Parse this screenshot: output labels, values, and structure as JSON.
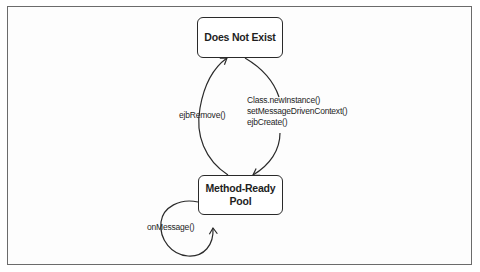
{
  "diagram": {
    "type": "state-diagram",
    "states": [
      {
        "id": "does_not_exist",
        "label": "Does Not Exist"
      },
      {
        "id": "method_ready_pool",
        "label_lines": [
          "Method-Ready",
          "Pool"
        ]
      }
    ],
    "transitions": [
      {
        "from": "does_not_exist",
        "to": "method_ready_pool",
        "labels": [
          "Class.newInstance()",
          "setMessageDrivenContext()",
          "ejbCreate()"
        ]
      },
      {
        "from": "method_ready_pool",
        "to": "does_not_exist",
        "labels": [
          "ejbRemove()"
        ]
      },
      {
        "from": "method_ready_pool",
        "to": "method_ready_pool",
        "labels": [
          "onMessage()"
        ]
      }
    ]
  },
  "colors": {
    "stroke": "#2a2a2a",
    "frame": "#6b6b6b",
    "text": "#1e1e1e",
    "background": "#ffffff"
  }
}
